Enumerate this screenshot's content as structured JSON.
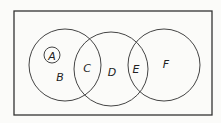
{
  "diagram": {
    "type": "venn",
    "frame": {
      "x": 14,
      "y": 11,
      "w": 198,
      "h": 104
    },
    "circles": [
      {
        "id": "A",
        "cx": 52,
        "cy": 55,
        "r": 8
      },
      {
        "id": "circle-left",
        "cx": 65,
        "cy": 65,
        "r": 36
      },
      {
        "id": "circle-middle",
        "cx": 111,
        "cy": 69,
        "r": 37
      },
      {
        "id": "circle-right",
        "cx": 164,
        "cy": 65,
        "r": 36
      }
    ],
    "labels": {
      "A": "A",
      "B": "B",
      "C": "C",
      "D": "D",
      "E": "E",
      "F": "F"
    },
    "stroke_color": "#444444"
  }
}
